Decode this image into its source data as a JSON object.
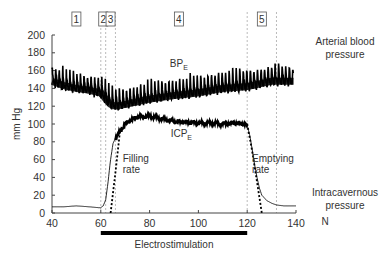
{
  "chart_data": {
    "type": "line",
    "title": "",
    "xlabel": "",
    "ylabel": "mm Hg",
    "x_unit_label": "N",
    "xlim": [
      40,
      140
    ],
    "ylim": [
      0,
      200
    ],
    "x_ticks": [
      40,
      60,
      80,
      100,
      120,
      140
    ],
    "y_ticks": [
      0,
      20,
      40,
      60,
      80,
      100,
      120,
      140,
      160,
      180,
      200
    ],
    "grid": false,
    "phases": [
      {
        "label": "1",
        "x": 50
      },
      {
        "label": "2",
        "x": 61
      },
      {
        "label": "3",
        "x": 64
      },
      {
        "label": "4",
        "x": 92
      },
      {
        "label": "5",
        "x": 126
      }
    ],
    "phase_boundaries": [
      60,
      62,
      66,
      120,
      132
    ],
    "series": [
      {
        "name": "Arterial blood pressure",
        "label": "BP",
        "label_subscript": "E",
        "label_x": 92,
        "label_y": 164,
        "style": "oscillating",
        "x": [
          40,
          45,
          50,
          55,
          60,
          62,
          64,
          66,
          70,
          80,
          90,
          100,
          110,
          120,
          125,
          130,
          135,
          139
        ],
        "mean": [
          148,
          143,
          140,
          138,
          135,
          128,
          122,
          120,
          122,
          128,
          132,
          135,
          140,
          142,
          145,
          148,
          148,
          148
        ],
        "amplitude": [
          20,
          20,
          20,
          20,
          22,
          22,
          22,
          22,
          22,
          22,
          22,
          22,
          24,
          24,
          22,
          22,
          22,
          20
        ]
      },
      {
        "name": "Intracavernous pressure",
        "label": "ICP",
        "label_subscript": "E",
        "label_x": 93,
        "label_y": 85,
        "style": "solid",
        "x": [
          40,
          45,
          50,
          55,
          59,
          60,
          61,
          62,
          63,
          64,
          65,
          66,
          67,
          68,
          70,
          72,
          75,
          80,
          85,
          90,
          95,
          100,
          105,
          110,
          115,
          119,
          120,
          121,
          122,
          123,
          124,
          125,
          126,
          128,
          130,
          132,
          135,
          140
        ],
        "y": [
          7,
          7,
          8,
          7,
          6,
          6,
          8,
          15,
          35,
          60,
          78,
          84,
          88,
          92,
          100,
          104,
          108,
          109,
          106,
          103,
          102,
          101,
          101,
          100,
          101,
          100,
          98,
          88,
          72,
          55,
          40,
          28,
          20,
          14,
          11,
          9,
          8,
          8
        ]
      },
      {
        "name": "Filling rate",
        "style": "dotted",
        "x": [
          64,
          66,
          68
        ],
        "y": [
          0,
          45,
          95
        ]
      },
      {
        "name": "Emptying rate",
        "style": "dotted",
        "x": [
          120,
          122,
          124,
          126
        ],
        "y": [
          100,
          70,
          35,
          0
        ]
      }
    ],
    "annotations": [
      {
        "text": "Filling",
        "x": 69,
        "y": 57
      },
      {
        "text": "rate",
        "x": 69,
        "y": 45
      },
      {
        "text": "Emptying",
        "x": 122,
        "y": 57
      },
      {
        "text": "rate",
        "x": 122,
        "y": 45
      }
    ],
    "stimulation_bar": {
      "label": "Electrostimulation",
      "start": 60,
      "end": 120
    }
  },
  "labels": {
    "arterial_line1": "Arterial blood",
    "arterial_line2": "pressure",
    "icp_line1": "Intracavernous",
    "icp_line2": "pressure",
    "unit_n": "N"
  }
}
